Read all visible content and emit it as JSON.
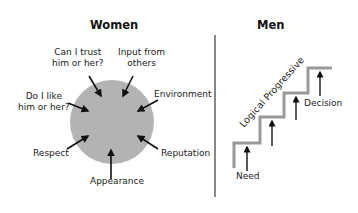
{
  "women": {
    "title": "Women",
    "circle_color": "#b3b3b3",
    "factors": [
      {
        "line1": "Can I trust",
        "line2": "him or her?"
      },
      {
        "line1": "Input from",
        "line2": "others"
      },
      {
        "line1": "Environment",
        "line2": ""
      },
      {
        "line1": "Reputation",
        "line2": ""
      },
      {
        "line1": "Appearance",
        "line2": ""
      },
      {
        "line1": "Respect",
        "line2": ""
      },
      {
        "line1": "Do I like",
        "line2": "him or her?"
      }
    ]
  },
  "men": {
    "title": "Men",
    "diagonal_label": "Logical Progressive",
    "start_label": "Need",
    "end_label": "Decision",
    "stair_color": "#999999"
  },
  "divider_color": "#555555"
}
